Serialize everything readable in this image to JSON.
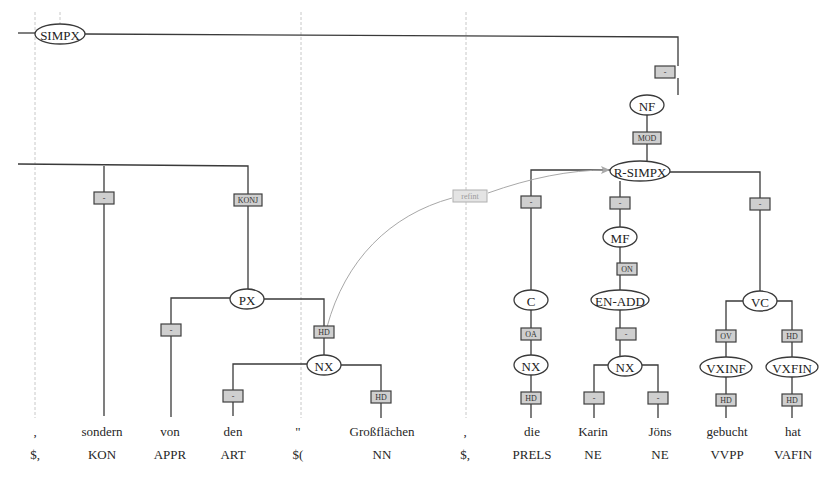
{
  "diagram": {
    "type": "syntax-tree",
    "tokens": [
      {
        "word": ",",
        "pos": "$,",
        "x": 35
      },
      {
        "word": "sondern",
        "pos": "KON",
        "x": 102
      },
      {
        "word": "von",
        "pos": "APPR",
        "x": 170
      },
      {
        "word": "den",
        "pos": "ART",
        "x": 233
      },
      {
        "word": "\"",
        "pos": "$(",
        "x": 298
      },
      {
        "word": "Großflächen",
        "pos": "NN",
        "x": 382
      },
      {
        "word": ",",
        "pos": "$,",
        "x": 465
      },
      {
        "word": "die",
        "pos": "PRELS",
        "x": 532
      },
      {
        "word": "Karin",
        "pos": "NE",
        "x": 593
      },
      {
        "word": "Jöns",
        "pos": "NE",
        "x": 660
      },
      {
        "word": "gebucht",
        "pos": "VVPP",
        "x": 727
      },
      {
        "word": "hat",
        "pos": "VAFIN",
        "x": 793
      }
    ],
    "nodes": [
      {
        "id": "simpx",
        "label": "SIMPX",
        "x": 60,
        "y": 34,
        "rx": 25,
        "ry": 10
      },
      {
        "id": "nf",
        "label": "NF",
        "x": 647,
        "y": 105,
        "rx": 17,
        "ry": 10
      },
      {
        "id": "r-simpx",
        "label": "R-SIMPX",
        "x": 640,
        "y": 171,
        "rx": 30,
        "ry": 10
      },
      {
        "id": "px",
        "label": "PX",
        "x": 247,
        "y": 299,
        "rx": 17,
        "ry": 10
      },
      {
        "id": "nx-1",
        "label": "NX",
        "x": 324,
        "y": 365,
        "rx": 17,
        "ry": 10
      },
      {
        "id": "c",
        "label": "C",
        "x": 531,
        "y": 300,
        "rx": 17,
        "ry": 10
      },
      {
        "id": "nx-2",
        "label": "NX",
        "x": 531,
        "y": 365,
        "rx": 17,
        "ry": 10
      },
      {
        "id": "mf",
        "label": "MF",
        "x": 620,
        "y": 237,
        "rx": 17,
        "ry": 10
      },
      {
        "id": "en-add",
        "label": "EN-ADD",
        "x": 620,
        "y": 300,
        "rx": 29,
        "ry": 10
      },
      {
        "id": "nx-3",
        "label": "NX",
        "x": 625,
        "y": 366,
        "rx": 17,
        "ry": 10
      },
      {
        "id": "vc",
        "label": "VC",
        "x": 760,
        "y": 301,
        "rx": 17,
        "ry": 10
      },
      {
        "id": "vxinf",
        "label": "VXINF",
        "x": 726,
        "y": 367,
        "rx": 26,
        "ry": 10
      },
      {
        "id": "vxfin",
        "label": "VXFIN",
        "x": 792,
        "y": 367,
        "rx": 26,
        "ry": 10
      }
    ],
    "edge_labels": [
      {
        "label": "-",
        "x": 665,
        "y": 72
      },
      {
        "label": "MOD",
        "x": 647,
        "y": 138
      },
      {
        "label": "-",
        "x": 104,
        "y": 198
      },
      {
        "label": "KONJ",
        "x": 248,
        "y": 200
      },
      {
        "label": "-",
        "x": 171,
        "y": 330
      },
      {
        "label": "HD",
        "x": 324,
        "y": 332
      },
      {
        "label": "-",
        "x": 233,
        "y": 396
      },
      {
        "label": "HD",
        "x": 381,
        "y": 397
      },
      {
        "label": "-",
        "x": 531,
        "y": 202
      },
      {
        "label": "-",
        "x": 620,
        "y": 203
      },
      {
        "label": "-",
        "x": 760,
        "y": 204
      },
      {
        "label": "ON",
        "x": 627,
        "y": 269
      },
      {
        "label": "OA",
        "x": 531,
        "y": 334
      },
      {
        "label": "-",
        "x": 626,
        "y": 334
      },
      {
        "label": "HD",
        "x": 531,
        "y": 398
      },
      {
        "label": "-",
        "x": 594,
        "y": 398
      },
      {
        "label": "-",
        "x": 658,
        "y": 398
      },
      {
        "label": "OV",
        "x": 726,
        "y": 336
      },
      {
        "label": "HD",
        "x": 792,
        "y": 336
      },
      {
        "label": "HD",
        "x": 726,
        "y": 400
      },
      {
        "label": "HD",
        "x": 792,
        "y": 400
      }
    ],
    "secondary_edge": {
      "label": "refint",
      "x": 470,
      "y": 196,
      "from": "HD (PX)",
      "to": "R-SIMPX"
    },
    "colors": {
      "line": "#3a3a3a",
      "label_fill": "#cfcfcf",
      "guide": "#c8c8c8",
      "secondary": "#a8a8a8"
    }
  }
}
